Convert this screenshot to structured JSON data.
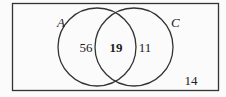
{
  "diagram": {
    "type": "venn",
    "universe": {
      "label": "",
      "outside_count": "14"
    },
    "sets": [
      {
        "name": "A",
        "only_count": "56"
      },
      {
        "name": "C",
        "only_count": "11"
      }
    ],
    "intersection": {
      "sets": [
        "A",
        "C"
      ],
      "count": "19",
      "emphasized": true
    },
    "colors": {
      "stroke": "#333333",
      "text": "#222222",
      "background": "#fbfbfb"
    }
  }
}
